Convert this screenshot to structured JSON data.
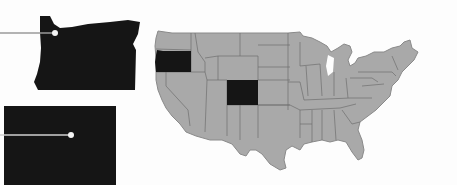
{
  "map": {
    "title": "",
    "region": "United States",
    "highlighted_states": [
      {
        "name": "Oregon",
        "callout_shape": "state-outline"
      },
      {
        "name": "Colorado",
        "callout_shape": "rectangle"
      }
    ],
    "colors": {
      "background": "#fdfdfd",
      "land": "#a9a9a9",
      "border": "#6e6e6e",
      "highlight": "#151515",
      "leader_line": "#9a9a9a",
      "marker_dot": "#f4f4f4"
    }
  }
}
